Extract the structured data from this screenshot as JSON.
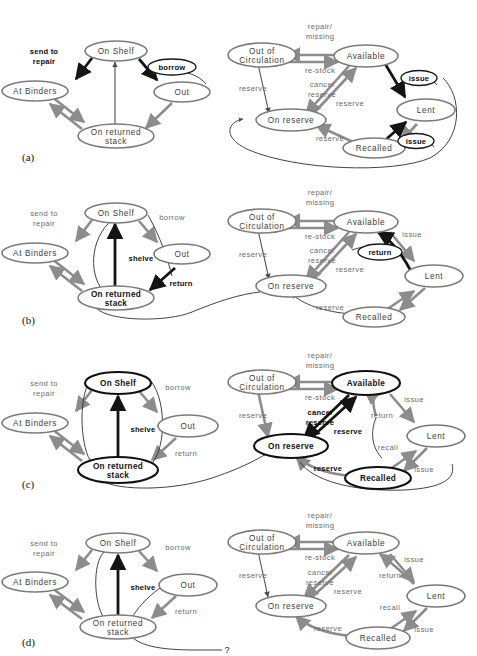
{
  "figure": {
    "top_caption": "",
    "panels": [
      {
        "tag": "(a)"
      },
      {
        "tag": "(b)"
      },
      {
        "tag": "(c)"
      },
      {
        "tag": "(d)"
      }
    ],
    "question_mark": "?"
  },
  "colors": {
    "node_stroke": "#7b7b7b",
    "node_stroke_bold": "#101010",
    "edge": "#8c8c8c",
    "edge_dark": "#141414",
    "label": "#6a6a6a",
    "label_bold": "#0d0d0d",
    "background": "#ffffff"
  },
  "states": {
    "on_shelf": "On  Shelf",
    "at_binders": "At  Binders",
    "on_returned_stack_1": "On  returned",
    "on_returned_stack_2": "stack",
    "out": "Out",
    "out_of_circulation_1": "Out  of",
    "out_of_circulation_2": "Circulation",
    "available": "Available",
    "on_reserve": "On  reserve",
    "lent": "Lent",
    "recalled": "Recalled"
  },
  "transitions": {
    "send_to_1": "send  to",
    "send_to_2": "repair",
    "borrow": "borrow",
    "return": "return",
    "shelve": "shelve",
    "repair_1": "repair/",
    "repair_2": "missing",
    "re_stock": "re-stock",
    "cancel_1": "cancel",
    "cancel_2": "reserve",
    "reserve": "reserve",
    "issue": "issue",
    "recall": "recall"
  },
  "panel_a": {
    "tag": "(a)",
    "left_nodes": [
      {
        "name": "on-shelf",
        "label_key": "on_shelf",
        "bold": false
      },
      {
        "name": "at-binders",
        "label_key": "at_binders",
        "bold": false
      },
      {
        "name": "on-returned-stack",
        "label_key": "on_returned_stack_1",
        "bold": false
      },
      {
        "name": "out",
        "label_key": "out",
        "bold": false
      }
    ],
    "left_edges": [
      {
        "from": "on-shelf",
        "to": "at-binders",
        "label": "send  to repair",
        "bold_label": true
      },
      {
        "from": "on-shelf",
        "to": "out",
        "label": "borrow",
        "bubble": true
      },
      {
        "from": "at-binders",
        "to": "on-returned-stack",
        "label": ""
      },
      {
        "from": "on-returned-stack",
        "to": "at-binders",
        "label": ""
      },
      {
        "from": "on-returned-stack",
        "to": "on-shelf",
        "label": ""
      },
      {
        "from": "out",
        "to": "on-returned-stack",
        "label": ""
      }
    ],
    "right_nodes": [
      {
        "name": "out-of-circulation",
        "bold": false
      },
      {
        "name": "available",
        "bold": false
      },
      {
        "name": "on-reserve",
        "bold": false
      },
      {
        "name": "lent",
        "bold": false
      },
      {
        "name": "recalled",
        "bold": false
      }
    ],
    "right_edges": [
      {
        "from": "available",
        "to": "out-of-circulation",
        "label": "repair/ missing"
      },
      {
        "from": "out-of-circulation",
        "to": "available",
        "label": "re-stock"
      },
      {
        "from": "out-of-circulation",
        "to": "on-reserve",
        "label": "reserve"
      },
      {
        "from": "available",
        "to": "on-reserve",
        "label": "cancel reserve"
      },
      {
        "from": "on-reserve",
        "to": "available",
        "label": "reserve"
      },
      {
        "from": "available",
        "to": "lent",
        "label": "issue",
        "bubble": true
      },
      {
        "from": "lent",
        "to": "recalled",
        "label": ""
      },
      {
        "from": "recalled",
        "to": "lent",
        "label": "issue",
        "bubble": true
      },
      {
        "from": "recalled",
        "to": "on-reserve",
        "label": "reserve"
      },
      {
        "from": "lent",
        "to": "available",
        "label": ""
      }
    ]
  },
  "panel_b": {
    "tag": "(b)",
    "bold_labels": [
      "borrow-not-bold",
      "return",
      "shelve"
    ],
    "left_edges_new": [
      {
        "from": "out",
        "to": "on-returned-stack",
        "label": "return",
        "bold_label": true
      },
      {
        "from": "on-returned-stack",
        "to": "on-shelf",
        "label": "shelve",
        "bold_label": true
      }
    ],
    "right_edges_new": [
      {
        "from": "lent",
        "to": "available",
        "label": "return",
        "bold_label": true
      }
    ]
  },
  "panel_c": {
    "tag": "(c)",
    "left_bold_nodes": [
      "on-shelf",
      "on-returned-stack"
    ],
    "right_bold_nodes": [
      "available",
      "on-reserve",
      "recalled"
    ],
    "bold_edge_labels": [
      "shelve",
      "cancel reserve",
      "reserve"
    ],
    "extra_right_labels": [
      "return",
      "recall",
      "issue"
    ]
  },
  "panel_d": {
    "tag": "(d)",
    "left_bold_nodes": [],
    "bold_edge_labels": [
      "shelve"
    ],
    "dangling_marker": "?"
  }
}
